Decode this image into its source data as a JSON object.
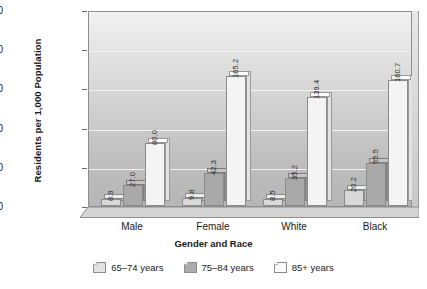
{
  "chart_data": {
    "type": "bar",
    "title": "",
    "xlabel": "Gender and Race",
    "ylabel": "Residents per 1,000 Population",
    "categories": [
      "Male",
      "Female",
      "White",
      "Black"
    ],
    "series": [
      {
        "name": "65–74 years",
        "values": [
          8.9,
          9.8,
          8.5,
          20.2
        ],
        "color": "#d9d9d9"
      },
      {
        "name": "75–84 years",
        "values": [
          27.0,
          42.3,
          35.2,
          55.5
        ],
        "color": "#a9a9a9"
      },
      {
        "name": "85+ years",
        "values": [
          80.0,
          165.2,
          139.4,
          160.7
        ],
        "color": "#f4f4f4"
      }
    ],
    "value_labels": [
      [
        "8.9",
        "27.0",
        "80.0"
      ],
      [
        "9.8",
        "42.3",
        "165.2"
      ],
      [
        "8.5",
        "35.2",
        "139.4"
      ],
      [
        "20.2",
        "55.5",
        "160.7"
      ]
    ],
    "ylim": [
      0,
      250
    ],
    "yticks": [
      0,
      50,
      100,
      150,
      200,
      250
    ],
    "ytick_labels": [
      "0",
      "50",
      "100",
      "150",
      "200",
      "250"
    ],
    "grid": true,
    "grid_axis": "y",
    "legend_position": "bottom",
    "style": "3d-bars-grayscale"
  },
  "legend": {
    "items": [
      {
        "label": "65–74 years"
      },
      {
        "label": "75–84 years"
      },
      {
        "label": "85+ years"
      }
    ]
  }
}
